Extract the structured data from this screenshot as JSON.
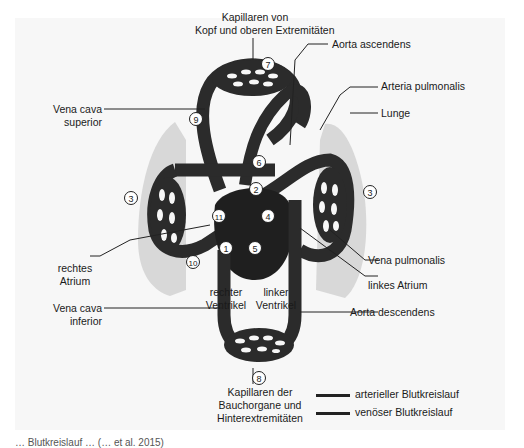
{
  "diagram": {
    "title": "Blutkreislauf",
    "labels": {
      "kapillaren_kopf": "Kapillaren von\nKopf und oberen Extremitäten",
      "kapillaren_kopf_l1": "Kapillaren von",
      "kapillaren_kopf_l2": "Kopf und oberen Extremitäten",
      "aorta_ascendens": "Aorta ascendens",
      "arteria_pulmonalis": "Arteria pulmonalis",
      "lunge": "Lunge",
      "vena_cava_superior_l1": "Vena cava",
      "vena_cava_superior_l2": "superior",
      "rechtes_atrium_l1": "rechtes",
      "rechtes_atrium_l2": "Atrium",
      "rechter_ventrikel_l1": "rechter",
      "rechter_ventrikel_l2": "Ventrikel",
      "linker_ventrikel_l1": "linker",
      "linker_ventrikel_l2": "Ventrikel",
      "vena_cava_inferior_l1": "Vena cava",
      "vena_cava_inferior_l2": "inferior",
      "vena_pulmonalis": "Vena pulmonalis",
      "linkes_atrium": "linkes Atrium",
      "aorta_descendens": "Aorta descendens",
      "kapillaren_bauch_l1": "Kapillaren der",
      "kapillaren_bauch_l2": "Bauchorgane und",
      "kapillaren_bauch_l3": "Hinterextremitäten"
    },
    "numbers": [
      "1",
      "2",
      "3",
      "3",
      "4",
      "5",
      "6",
      "7",
      "8",
      "9",
      "10",
      "11"
    ],
    "num": {
      "n1": "1",
      "n2": "2",
      "n3a": "3",
      "n3b": "3",
      "n4": "4",
      "n5": "5",
      "n6": "6",
      "n7": "7",
      "n8": "8",
      "n9": "9",
      "n10": "10",
      "n11": "11"
    },
    "legend": [
      {
        "label": "arterieller Blutkreislauf",
        "color": "#2a2a2a"
      },
      {
        "label": "venöser Blutkreislauf",
        "color": "#1e1e1e"
      }
    ],
    "colors": {
      "vessel": "#2b2b2b",
      "lung": "#d6d6d6",
      "background": "#f7f7f7",
      "heart": "#1f1f1f"
    },
    "caption": "… Blutkreislauf … (… et al. 2015)"
  }
}
